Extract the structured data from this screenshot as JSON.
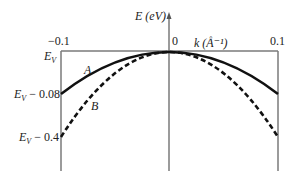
{
  "figure": {
    "y_axis_label": "E (eV)",
    "x_axis_label": "k (Å⁻¹)",
    "x_ticks": [
      {
        "label": "−0.1",
        "k": -0.1
      },
      {
        "label": "0",
        "k": 0
      },
      {
        "label": "0.1",
        "k": 0.1
      }
    ],
    "y_ticks": [
      {
        "label_main": "E",
        "label_sub": "V",
        "label_rest": ""
      },
      {
        "label_main": "E",
        "label_sub": "V",
        "label_rest": " − 0.08"
      },
      {
        "label_main": "E",
        "label_sub": "V",
        "label_rest": " − 0.4"
      }
    ],
    "curves": [
      {
        "name": "A",
        "style": "solid",
        "edge_energy": "E_V − 0.08"
      },
      {
        "name": "B",
        "style": "dashed",
        "edge_energy": "E_V − 0.4"
      }
    ],
    "colors": {
      "axis": "#7a7a7a",
      "curve": "#111111",
      "text": "#222222"
    }
  }
}
